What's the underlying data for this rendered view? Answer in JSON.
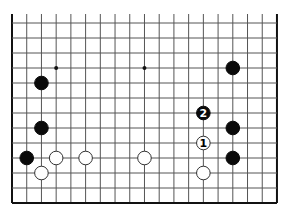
{
  "diagram": {
    "type": "go-board-fragment",
    "columns": 19,
    "rows": 13,
    "open_edge": "top",
    "grid": {
      "x0": 12,
      "y0": 23,
      "dx": 14.72,
      "dy": 15,
      "top_extend": 14
    },
    "colors": {
      "line": "#555555",
      "edge": "#111111",
      "black": "#0a0a0a",
      "white": "#ffffff",
      "stone_outline": "#333333"
    },
    "star_points": [
      {
        "col": 3,
        "row": 3
      },
      {
        "col": 9,
        "row": 3
      }
    ],
    "stones": [
      {
        "col": 2,
        "row": 4,
        "color": "black",
        "label": ""
      },
      {
        "col": 15,
        "row": 3,
        "color": "black",
        "label": ""
      },
      {
        "col": 2,
        "row": 7,
        "color": "black",
        "label": ""
      },
      {
        "col": 13,
        "row": 6,
        "color": "black",
        "label": "2"
      },
      {
        "col": 15,
        "row": 7,
        "color": "black",
        "label": ""
      },
      {
        "col": 13,
        "row": 8,
        "color": "white",
        "label": "1"
      },
      {
        "col": 1,
        "row": 9,
        "color": "black",
        "label": ""
      },
      {
        "col": 3,
        "row": 9,
        "color": "white",
        "label": ""
      },
      {
        "col": 5,
        "row": 9,
        "color": "white",
        "label": ""
      },
      {
        "col": 9,
        "row": 9,
        "color": "white",
        "label": ""
      },
      {
        "col": 15,
        "row": 9,
        "color": "black",
        "label": ""
      },
      {
        "col": 2,
        "row": 10,
        "color": "white",
        "label": ""
      },
      {
        "col": 13,
        "row": 10,
        "color": "white",
        "label": ""
      }
    ]
  }
}
